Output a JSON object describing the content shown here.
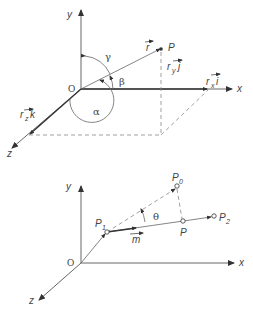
{
  "figure_top": {
    "axes": {
      "x": "x",
      "y": "y",
      "z": "z",
      "origin": "O"
    },
    "point": "P",
    "vector": "r",
    "components": {
      "x": {
        "base": "r",
        "sub": "x",
        "unit": "i"
      },
      "y": {
        "base": "r",
        "sub": "y",
        "unit": "j"
      },
      "z": {
        "base": "r",
        "sub": "z",
        "unit": "k"
      }
    },
    "angles": {
      "alpha": "α",
      "beta": "β",
      "gamma": "γ"
    }
  },
  "figure_bottom": {
    "axes": {
      "x": "x",
      "y": "y",
      "z": "z",
      "origin": "O"
    },
    "points": {
      "p0": {
        "base": "P",
        "sub": "0"
      },
      "p1": {
        "base": "P",
        "sub": "1"
      },
      "p2": {
        "base": "P",
        "sub": "2"
      },
      "p": "P"
    },
    "direction_vector": "m",
    "angle": "θ"
  }
}
